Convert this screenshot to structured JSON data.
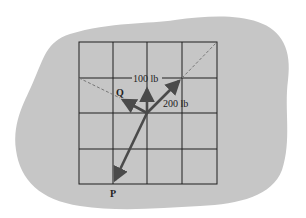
{
  "diagram": {
    "type": "force-vector-diagram",
    "background_color": "#c6c6c6",
    "grid_color": "#1e1e1e",
    "arrow_color": "#4a4a4a",
    "grid": {
      "columns": 4,
      "rows": 4
    },
    "forces": [
      {
        "id": "force-100",
        "label": "100 lb",
        "direction": "up"
      },
      {
        "id": "force-200",
        "label": "200 lb",
        "direction": "up-right"
      },
      {
        "id": "force-Q",
        "label": "Q",
        "direction": "up-left"
      },
      {
        "id": "force-P",
        "label": "P",
        "direction": "down-left"
      }
    ]
  }
}
